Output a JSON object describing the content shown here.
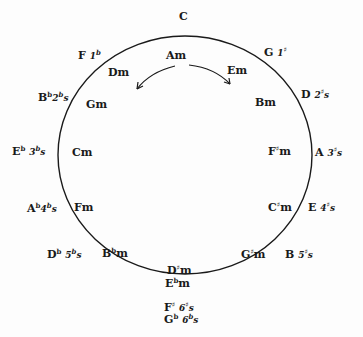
{
  "top_key": "C",
  "center_minor": "Am",
  "major_keys": [
    {
      "key": "G",
      "sig": "1#"
    },
    {
      "key": "D",
      "sig": "2#s"
    },
    {
      "key": "A",
      "sig": "3#s"
    },
    {
      "key": "E",
      "sig": "4#s"
    },
    {
      "key": "B",
      "sig": "5#s"
    },
    {
      "key": "F# / Gb",
      "sig": "6#s / 6bs"
    },
    {
      "key": "Db",
      "sig": "5bs"
    },
    {
      "key": "Ab",
      "sig": "4bs"
    },
    {
      "key": "Eb",
      "sig": "3bs"
    },
    {
      "key": "Bb",
      "sig": "2bs"
    },
    {
      "key": "F",
      "sig": "1b"
    }
  ],
  "minor_keys": [
    "Em",
    "Bm",
    "F#m",
    "C#m",
    "G#m",
    "D#m / Ebm",
    "Bbm",
    "Fm",
    "Cm",
    "Gm",
    "Dm"
  ],
  "labels": {
    "C": "C",
    "Am": "Am",
    "G": "G",
    "G_sig": "1",
    "D": "D",
    "D_sig": "2",
    "A": "A",
    "A_sig": "3",
    "E": "E",
    "E_sig": "4",
    "B": "B",
    "B_sig": "5",
    "Fs": "F",
    "Fs_sig": "6",
    "Gb": "G",
    "Gb_sig": "6",
    "Db": "D",
    "Db_sig": "5",
    "Ab": "A",
    "Ab_sig": "4",
    "Eb": "E",
    "Eb_sig": "3",
    "Bb": "B",
    "Bb_sig": "2",
    "F": "F",
    "F_sig": "1",
    "Em": "Em",
    "Bm": "Bm",
    "Fsm": "F",
    "Csm": "C",
    "Gsm": "G",
    "Dsm": "D",
    "Ebm": "E",
    "Bbm": "B",
    "Fm": "Fm",
    "Cm": "Cm",
    "Gm": "Gm",
    "Dm": "Dm",
    "m": "m",
    "s": "s",
    "sharp": "♯",
    "flat": "b"
  },
  "colors": {
    "ink": "#1a1a1a",
    "paper": "#fdfdfd"
  }
}
